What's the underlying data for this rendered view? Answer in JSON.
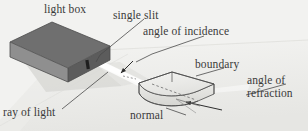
{
  "figure": {
    "background_color": "#f2f2f0",
    "ink_color": "#3a3a3a"
  },
  "labels": {
    "light_box": "light box",
    "single_slit": "single slit",
    "angle_of_incidence": "angle of incidence",
    "boundary": "boundary",
    "angle_of_refraction_line1": "angle of",
    "angle_of_refraction_line2": "refraction",
    "normal": "normal",
    "ray_of_light": "ray of light"
  },
  "objects": {
    "light_box": {
      "name": "light box",
      "shape": "rectangular-prism",
      "top_color": "#6e6e6e",
      "front_color": "#8d8d8d",
      "side_color": "#5b5b5b"
    },
    "glass_block": {
      "name": "semicircular glass block",
      "shape": "semicircular-prism",
      "fill_color": "#e9e9e7",
      "edge_color": "#4a4a4a"
    },
    "light_beam": {
      "name": "light beam",
      "color": "#fbfbf9"
    },
    "shadow": {
      "name": "box shadow",
      "color": "#d8d8d6"
    }
  },
  "leader_lines": [
    {
      "name": "single-slit-leader",
      "from": "single slit",
      "to": "slit on box"
    },
    {
      "name": "angle-of-incidence-leader",
      "from": "angle of incidence",
      "to": "incidence angle marker"
    },
    {
      "name": "boundary-leader",
      "from": "boundary",
      "to": "flat face of block"
    },
    {
      "name": "angle-of-refraction-leader",
      "from": "angle of refraction",
      "to": "refraction angle marker"
    },
    {
      "name": "normal-leader",
      "from": "normal",
      "to": "normal dashed line"
    },
    {
      "name": "ray-of-light-leader",
      "from": "ray of light",
      "to": "light beam"
    }
  ]
}
